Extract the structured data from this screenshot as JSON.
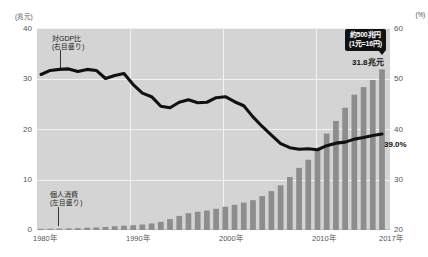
{
  "axes": {
    "left_unit": "(兆元)",
    "right_unit": "(%)",
    "left_ticks": [
      "40",
      "30",
      "20",
      "10",
      "0"
    ],
    "right_ticks": [
      "60",
      "50",
      "40",
      "30",
      "20"
    ],
    "x_labels": [
      "1980年",
      "1990年",
      "2000年",
      "2010年",
      "2017年"
    ]
  },
  "legends": {
    "line": {
      "line1": "対GDP比",
      "line2": "(右目盛り)"
    },
    "bars": {
      "line1": "個人消費",
      "line2": "(左目盛り)"
    }
  },
  "annotations": {
    "callout_line1": "約500兆円",
    "callout_line2": "(1元=16円)",
    "bar_value": "31.8兆元",
    "line_value": "39.0%"
  },
  "colors": {
    "plot_background": "#d4d4d4",
    "bar": "#8d8d8d",
    "line": "#111111",
    "grid": "#f2f2f2",
    "callout_background": "#111111",
    "text": "#555555"
  },
  "chart_data": {
    "type": "bar",
    "title": "",
    "subtitle": "",
    "xlabel": "",
    "ylabel": "兆元",
    "y2label": "%",
    "ylim": [
      0,
      40
    ],
    "y2lim": [
      20,
      60
    ],
    "grid": true,
    "legend_position": "inline-annotation",
    "x": [
      1980,
      1981,
      1982,
      1983,
      1984,
      1985,
      1986,
      1987,
      1988,
      1989,
      1990,
      1991,
      1992,
      1993,
      1994,
      1995,
      1996,
      1997,
      1998,
      1999,
      2000,
      2001,
      2002,
      2003,
      2004,
      2005,
      2006,
      2007,
      2008,
      2009,
      2010,
      2011,
      2012,
      2013,
      2014,
      2015,
      2016,
      2017
    ],
    "series": [
      {
        "name": "個人消費",
        "type": "bar",
        "axis": "left",
        "unit": "兆元",
        "values": [
          0.23,
          0.25,
          0.28,
          0.31,
          0.36,
          0.45,
          0.51,
          0.6,
          0.75,
          0.85,
          0.94,
          1.08,
          1.29,
          1.61,
          2.17,
          2.79,
          3.31,
          3.62,
          3.85,
          4.2,
          4.6,
          4.98,
          5.43,
          5.9,
          6.7,
          7.7,
          8.85,
          10.5,
          12.3,
          13.9,
          16.0,
          19.1,
          21.6,
          24.2,
          26.8,
          28.3,
          29.7,
          31.8
        ]
      },
      {
        "name": "対GDP比",
        "type": "line",
        "axis": "right",
        "unit": "%",
        "values": [
          50.8,
          51.6,
          51.8,
          51.9,
          51.4,
          51.8,
          51.6,
          50.0,
          50.6,
          51.0,
          48.8,
          47.1,
          46.4,
          44.5,
          44.2,
          45.3,
          45.8,
          45.2,
          45.3,
          46.2,
          46.4,
          45.4,
          44.6,
          42.4,
          40.5,
          38.8,
          37.1,
          36.3,
          36.0,
          36.1,
          35.9,
          36.7,
          37.2,
          37.4,
          38.0,
          38.3,
          38.7,
          39.0
        ]
      }
    ],
    "annotations": [
      {
        "text": "約500兆円 (1元=16円)",
        "at_x": 2017,
        "series": "個人消費"
      },
      {
        "text": "31.8兆元",
        "at_x": 2017,
        "value": 31.8,
        "series": "個人消費"
      },
      {
        "text": "39.0%",
        "at_x": 2017,
        "value": 39.0,
        "series": "対GDP比"
      }
    ]
  }
}
